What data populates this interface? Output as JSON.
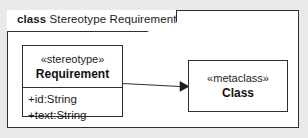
{
  "frame": {
    "keyword": "class",
    "name": " Stereotype Requirement"
  },
  "stereotype_box": {
    "stereotype": "«stereotype»",
    "name": "Requirement",
    "attributes": [
      "+id:String",
      "+text:String"
    ]
  },
  "metaclass_box": {
    "stereotype": "«metaclass»",
    "name": "Class"
  },
  "connector": {
    "kind": "extension-arrow"
  },
  "colors": {
    "page_background": "#e9e9e9",
    "frame_background": "#ffffff",
    "line": "#2e2e2e",
    "text": "#1c1c1c"
  }
}
